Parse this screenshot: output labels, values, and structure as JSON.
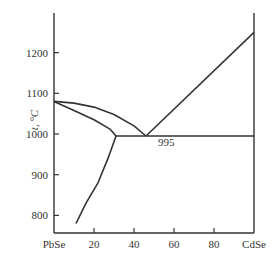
{
  "chart_data": {
    "type": "line",
    "title": "",
    "xlabel": "",
    "ylabel": "t, °C",
    "x_tick_labels": [
      "PbSe",
      "20",
      "40",
      "60",
      "80",
      "CdSe"
    ],
    "x_ticks": [
      0,
      20,
      40,
      60,
      80,
      100
    ],
    "y_tick_labels": [
      "800",
      "900",
      "1000",
      "1100",
      "1200"
    ],
    "y_ticks": [
      800,
      900,
      1000,
      1100,
      1200
    ],
    "xlim": [
      0,
      100
    ],
    "ylim": [
      745,
      1285
    ],
    "grid": false,
    "annotations": [
      {
        "text": "995",
        "x": 52,
        "y": 985
      }
    ],
    "series": [
      {
        "name": "liquidus (PbSe side)",
        "x": [
          0,
          10,
          20,
          30,
          40,
          46
        ],
        "y": [
          1080,
          1076,
          1066,
          1048,
          1020,
          995
        ]
      },
      {
        "name": "liquidus (CdSe side)",
        "x": [
          46,
          100
        ],
        "y": [
          995,
          1250
        ]
      },
      {
        "name": "solidus (PbSe-rich)",
        "x": [
          0,
          10,
          20,
          28,
          31
        ],
        "y": [
          1080,
          1058,
          1035,
          1012,
          995
        ]
      },
      {
        "name": "solvus",
        "x": [
          31,
          27,
          22,
          16,
          11
        ],
        "y": [
          995,
          940,
          880,
          830,
          780
        ]
      },
      {
        "name": "eutectic line",
        "x": [
          31,
          100
        ],
        "y": [
          995,
          995
        ]
      }
    ]
  }
}
